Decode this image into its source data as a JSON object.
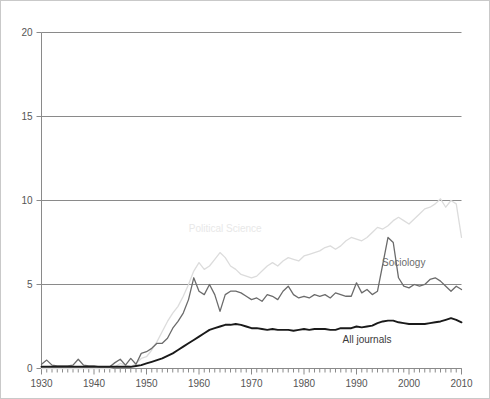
{
  "chart_data": {
    "type": "line",
    "title": "",
    "subtitle": "",
    "xlabel": "",
    "ylabel": "",
    "xlim": [
      1930,
      2010
    ],
    "ylim": [
      0,
      20
    ],
    "grid": true,
    "legend_position": "inline-annotations",
    "x_ticks": [
      1930,
      1940,
      1950,
      1960,
      1970,
      1980,
      1990,
      2000,
      2010
    ],
    "x_minor_tick_step": 1,
    "y_ticks": [
      0,
      5,
      10,
      15,
      20
    ],
    "x": [
      1930,
      1931,
      1932,
      1933,
      1934,
      1935,
      1936,
      1937,
      1938,
      1939,
      1940,
      1941,
      1942,
      1943,
      1944,
      1945,
      1946,
      1947,
      1948,
      1949,
      1950,
      1951,
      1952,
      1953,
      1954,
      1955,
      1956,
      1957,
      1958,
      1959,
      1960,
      1961,
      1962,
      1963,
      1964,
      1965,
      1966,
      1967,
      1968,
      1969,
      1970,
      1971,
      1972,
      1973,
      1974,
      1975,
      1976,
      1977,
      1978,
      1979,
      1980,
      1981,
      1982,
      1983,
      1984,
      1985,
      1986,
      1987,
      1988,
      1989,
      1990,
      1991,
      1992,
      1993,
      1994,
      1995,
      1996,
      1997,
      1998,
      1999,
      2000,
      2001,
      2002,
      2003,
      2004,
      2005,
      2006,
      2007,
      2008,
      2009,
      2010
    ],
    "series": [
      {
        "name": "Political Science",
        "color": "#dcdcdc",
        "label_x": 1965,
        "label_y": 8.1,
        "values": [
          0.0,
          0.0,
          0.0,
          0.0,
          0.0,
          0.0,
          0.0,
          0.0,
          0.0,
          0.0,
          0.0,
          0.0,
          0.0,
          0.0,
          0.1,
          0.3,
          0.2,
          0.1,
          0.3,
          0.6,
          0.7,
          1.1,
          1.6,
          2.2,
          2.8,
          3.3,
          3.7,
          4.3,
          5.0,
          5.8,
          6.3,
          5.9,
          6.1,
          6.5,
          6.9,
          6.6,
          6.1,
          5.9,
          5.6,
          5.5,
          5.4,
          5.5,
          5.8,
          6.1,
          6.3,
          6.1,
          6.4,
          6.6,
          6.5,
          6.4,
          6.7,
          6.8,
          6.9,
          7.0,
          7.2,
          7.3,
          7.1,
          7.3,
          7.6,
          7.8,
          7.7,
          7.6,
          7.8,
          8.1,
          8.4,
          8.3,
          8.5,
          8.8,
          9.0,
          8.8,
          8.6,
          8.9,
          9.2,
          9.5,
          9.6,
          9.8,
          10.1,
          9.6,
          10.0,
          9.8,
          7.8
        ]
      },
      {
        "name": "Sociology",
        "color": "#6b6b6b",
        "label_x": 1999,
        "label_y": 6.1,
        "values": [
          0.25,
          0.5,
          0.2,
          0.15,
          0.15,
          0.15,
          0.2,
          0.55,
          0.2,
          0.15,
          0.15,
          0.1,
          0.1,
          0.1,
          0.35,
          0.55,
          0.2,
          0.6,
          0.25,
          0.9,
          1.0,
          1.2,
          1.5,
          1.5,
          1.8,
          2.4,
          2.8,
          3.3,
          4.1,
          5.4,
          4.6,
          4.4,
          5.0,
          4.4,
          3.4,
          4.4,
          4.6,
          4.6,
          4.5,
          4.3,
          4.1,
          4.2,
          4.0,
          4.4,
          4.3,
          4.1,
          4.6,
          4.9,
          4.4,
          4.2,
          4.3,
          4.2,
          4.4,
          4.3,
          4.4,
          4.2,
          4.5,
          4.4,
          4.3,
          4.3,
          5.1,
          4.5,
          4.7,
          4.4,
          4.6,
          6.2,
          7.8,
          7.5,
          5.4,
          4.9,
          4.8,
          5.0,
          4.9,
          5.0,
          5.3,
          5.4,
          5.2,
          4.9,
          4.6,
          4.9,
          4.7
        ]
      },
      {
        "name": "All journals",
        "color": "#1a1a1a",
        "label_x": 1992,
        "label_y": 1.5,
        "values": [
          0.1,
          0.1,
          0.1,
          0.1,
          0.1,
          0.1,
          0.1,
          0.1,
          0.1,
          0.1,
          0.1,
          0.1,
          0.1,
          0.1,
          0.1,
          0.1,
          0.1,
          0.1,
          0.15,
          0.2,
          0.3,
          0.4,
          0.5,
          0.6,
          0.75,
          0.9,
          1.1,
          1.3,
          1.5,
          1.7,
          1.9,
          2.1,
          2.3,
          2.4,
          2.5,
          2.6,
          2.6,
          2.65,
          2.6,
          2.5,
          2.4,
          2.4,
          2.35,
          2.3,
          2.35,
          2.3,
          2.3,
          2.3,
          2.25,
          2.3,
          2.35,
          2.3,
          2.35,
          2.35,
          2.35,
          2.3,
          2.3,
          2.4,
          2.4,
          2.4,
          2.5,
          2.45,
          2.5,
          2.55,
          2.7,
          2.8,
          2.85,
          2.85,
          2.75,
          2.7,
          2.65,
          2.65,
          2.65,
          2.65,
          2.7,
          2.75,
          2.8,
          2.9,
          3.0,
          2.9,
          2.75
        ]
      }
    ]
  },
  "axis": {
    "y_tick_labels": [
      "0",
      "5",
      "10",
      "15",
      "20"
    ],
    "x_tick_labels": [
      "1930",
      "1940",
      "1950",
      "1960",
      "1970",
      "1980",
      "1990",
      "2000",
      "2010"
    ]
  },
  "labels": {
    "political_science": "Political Science",
    "sociology": "Sociology",
    "all_journals": "All journals"
  },
  "colors": {
    "political_science": "#dcdcdc",
    "sociology": "#6b6b6b",
    "all_journals": "#1a1a1a",
    "gridline": "#8a8a8a",
    "axis": "#8a8a8a",
    "tick_text": "#555555",
    "background": "#ffffff",
    "border": "#c9c9c9"
  }
}
